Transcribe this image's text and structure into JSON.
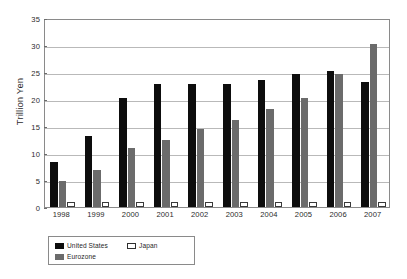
{
  "chart_data": {
    "type": "bar",
    "title": "",
    "subtitle": "",
    "xlabel": "",
    "ylabel": "Trillion Yen",
    "categories": [
      "1998",
      "1999",
      "2000",
      "2001",
      "2002",
      "2003",
      "2004",
      "2005",
      "2006",
      "2007"
    ],
    "series": [
      {
        "name": "United States",
        "color": "#0d0d0d",
        "values": [
          8.3,
          13.1,
          20.2,
          22.7,
          22.7,
          22.8,
          23.6,
          24.6,
          25.1,
          23.1
        ]
      },
      {
        "name": "Eurozone",
        "color": "#6b6b6b",
        "values": [
          4.8,
          6.8,
          11.0,
          12.5,
          14.5,
          16.2,
          18.2,
          20.2,
          24.7,
          30.1
        ]
      },
      {
        "name": "Japan",
        "color": "#ffffff",
        "values": [
          1.0,
          0.9,
          0.9,
          1.0,
          1.0,
          1.0,
          0.9,
          0.9,
          1.0,
          1.0
        ]
      }
    ],
    "ylim": [
      0,
      35
    ],
    "yticks": [
      0,
      5,
      10,
      15,
      20,
      25,
      30,
      35
    ],
    "ytick_labels": [
      "0",
      "5",
      "10",
      "15",
      "20",
      "25",
      "30",
      "35"
    ],
    "grid": true,
    "legend_position": "bottom-left"
  },
  "legend": {
    "entries": [
      {
        "label": "United States",
        "swatch": "black-square-icon"
      },
      {
        "label": "Eurozone",
        "swatch": "gray-square-icon"
      },
      {
        "label": "Japan",
        "swatch": "white-square-icon"
      }
    ]
  }
}
